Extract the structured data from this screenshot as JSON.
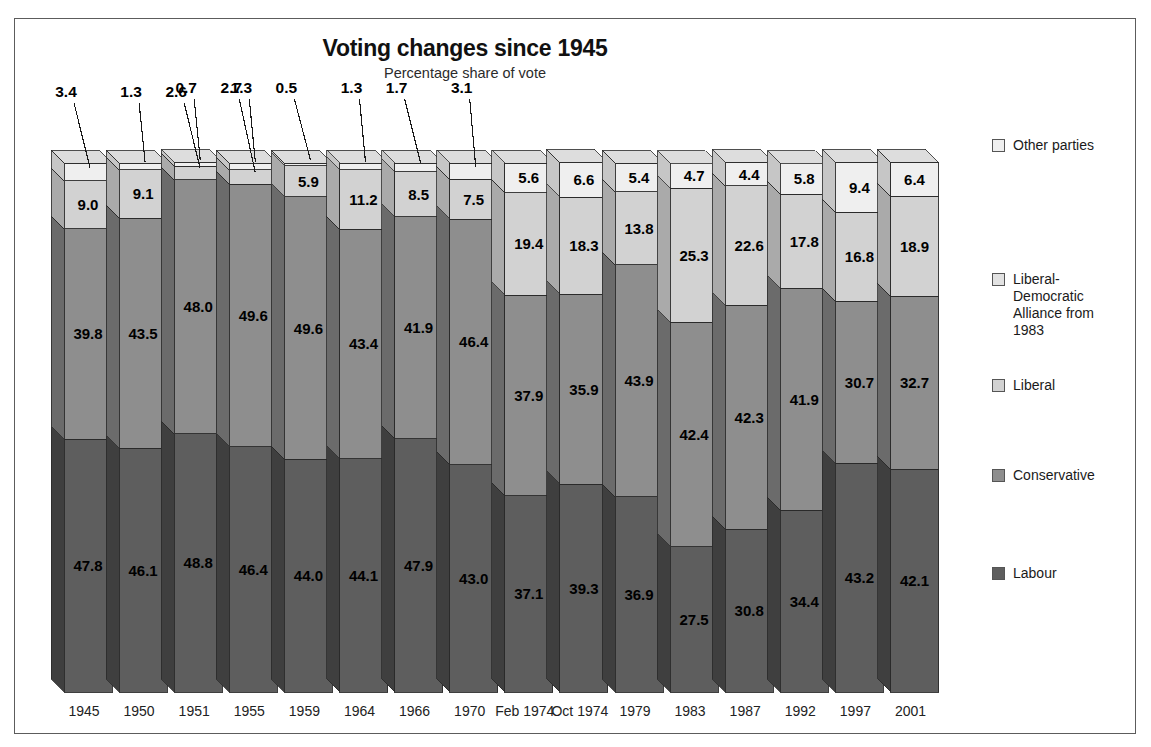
{
  "page": {
    "background": "#ffffff",
    "frame_border_color": "#5c5c5c"
  },
  "header": {
    "title": "Voting changes since 1945",
    "subtitle": "Percentage share of vote"
  },
  "legend": {
    "items": [
      {
        "label": "Other parties",
        "color": "#efefef",
        "top": 18
      },
      {
        "label": "Liberal-\nDemocratic\nAlliance from\n1983",
        "color": "#e2e2e2",
        "top": 152
      },
      {
        "label": "Liberal",
        "color": "#d2d2d2",
        "top": 258
      },
      {
        "label": "Conservative",
        "color": "#8e8e8e",
        "top": 348
      },
      {
        "label": "Labour",
        "color": "#5e5e5e",
        "top": 446
      }
    ]
  },
  "chart_data": {
    "type": "bar",
    "subtype": "stacked-3d-column",
    "title": "Voting changes since 1945",
    "subtitle": "Percentage share of vote",
    "xlabel": "",
    "ylabel": "Percentage share of vote",
    "ylim": [
      0,
      100
    ],
    "grid": false,
    "legend_position": "right",
    "stack_order_bottom_to_top": [
      "Labour",
      "Conservative",
      "Liberal",
      "Other parties"
    ],
    "categories": [
      "1945",
      "1950",
      "1951",
      "1955",
      "1959",
      "1964",
      "1966",
      "1970",
      "Feb 1974",
      "Oct 1974",
      "1979",
      "1983",
      "1987",
      "1992",
      "1997",
      "2001"
    ],
    "series": [
      {
        "name": "Labour",
        "color": "#5e5e5e",
        "side_color": "#3f3f3f",
        "top_color": "#4f4f4f",
        "values": [
          47.8,
          46.1,
          48.8,
          46.4,
          44.0,
          44.1,
          47.9,
          43.0,
          37.1,
          39.3,
          36.9,
          27.5,
          30.8,
          34.4,
          43.2,
          42.1
        ]
      },
      {
        "name": "Conservative",
        "color": "#8e8e8e",
        "side_color": "#6b6b6b",
        "top_color": "#7d7d7d",
        "values": [
          39.8,
          43.5,
          48.0,
          49.6,
          49.6,
          43.4,
          41.9,
          46.4,
          37.9,
          35.9,
          43.9,
          42.4,
          42.3,
          41.9,
          30.7,
          32.7
        ]
      },
      {
        "name": "Liberal",
        "color": "#d2d2d2",
        "side_color": "#aaaaaa",
        "top_color": "#c0c0c0",
        "values": [
          9.0,
          9.1,
          2.6,
          2.7,
          5.9,
          11.2,
          8.5,
          7.5,
          19.4,
          18.3,
          13.8,
          25.3,
          22.6,
          17.8,
          16.8,
          18.9
        ]
      },
      {
        "name": "Other parties",
        "color": "#efefef",
        "side_color": "#c6c6c6",
        "top_color": "#dddddd",
        "values": [
          3.4,
          1.3,
          0.7,
          1.3,
          0.5,
          1.3,
          1.7,
          3.1,
          5.6,
          6.6,
          5.4,
          4.7,
          4.4,
          5.8,
          9.4,
          6.4
        ]
      }
    ],
    "callouts": [
      {
        "category": "1950",
        "series": "Other parties",
        "value": "1.3"
      },
      {
        "category": "1951",
        "series": "Liberal",
        "value": "2.6"
      },
      {
        "category": "1951",
        "series": "Other parties",
        "value": "0.7"
      },
      {
        "category": "1955",
        "series": "Liberal",
        "value": "2.7"
      },
      {
        "category": "1955",
        "series": "Other parties",
        "value": "1.3"
      },
      {
        "category": "1959",
        "series": "Other parties",
        "value": "0.5"
      },
      {
        "category": "1964",
        "series": "Other parties",
        "value": "1.3"
      },
      {
        "category": "1966",
        "series": "Other parties",
        "value": "1.7"
      }
    ],
    "inline_labels": {
      "note": "Each visible segment shows its percentage inside the column; very small segments use leader-line callouts above the chart."
    }
  }
}
